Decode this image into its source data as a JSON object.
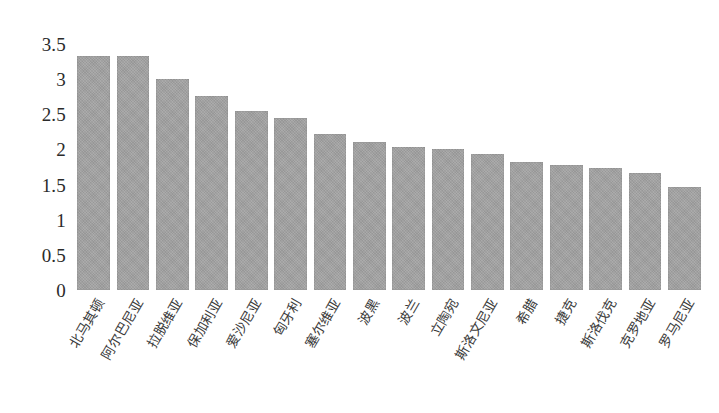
{
  "chart_data": {
    "type": "bar",
    "title": "",
    "subtitle": "",
    "xlabel": "",
    "ylabel": "",
    "ylim": [
      0,
      3.5
    ],
    "yticks": [
      "0",
      "0.5",
      "1",
      "1.5",
      "2",
      "2.5",
      "3",
      "3.5"
    ],
    "ytick_values": [
      0,
      0.5,
      1,
      1.5,
      2,
      2.5,
      3,
      3.5
    ],
    "grid": false,
    "legend": null,
    "legend_position": "none",
    "bar_color": "#a2a2a2",
    "categories": [
      "北马其顿",
      "阿尔巴尼亚",
      "拉脱维亚",
      "保加利亚",
      "爱沙尼亚",
      "匈牙利",
      "塞尔维亚",
      "波黑",
      "波兰",
      "立陶宛",
      "斯洛文尼亚",
      "希腊",
      "捷克",
      "斯洛伐克",
      "克罗地亚",
      "罗马尼亚"
    ],
    "values": [
      3.33,
      3.33,
      3.0,
      2.76,
      2.54,
      2.45,
      2.22,
      2.11,
      2.04,
      2.0,
      1.94,
      1.82,
      1.78,
      1.73,
      1.67,
      1.47
    ]
  }
}
